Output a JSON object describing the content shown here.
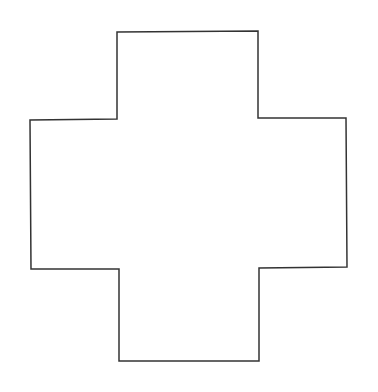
{
  "diagram": {
    "shape": "cross",
    "stroke_color": "#333333",
    "fill_color": "#ffffff",
    "background": "#ffffff",
    "stroke_width": 1.5,
    "points": "117,32 258,31 258,118 346,118 347,267 259,268 259,361 119,361 119,269 31,269 30,120 117,119"
  }
}
